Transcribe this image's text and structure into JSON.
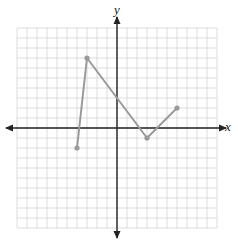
{
  "chart_data": {
    "type": "line",
    "title": "",
    "xlabel": "x",
    "ylabel": "y",
    "xlim": [
      -10,
      10
    ],
    "ylim": [
      -10,
      10
    ],
    "grid": true,
    "legend": null,
    "series": [
      {
        "name": "piecewise",
        "points": [
          [
            -4,
            -2
          ],
          [
            -3,
            7
          ],
          [
            3,
            -1
          ],
          [
            6,
            2
          ]
        ],
        "x": [
          -4,
          -3,
          3,
          6
        ],
        "y": [
          -2,
          7,
          -1,
          2
        ]
      }
    ],
    "colors": {
      "line": "#9a9a9a",
      "grid": "#d4d4d4",
      "axis": "#222222"
    }
  },
  "labels": {
    "x": "x",
    "y": "y"
  }
}
